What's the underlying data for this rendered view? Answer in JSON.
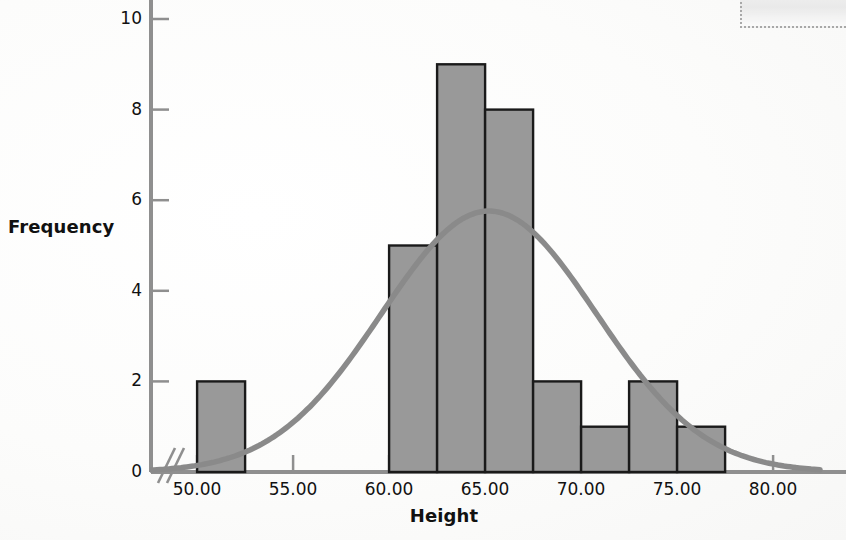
{
  "chart_data": {
    "type": "bar",
    "title": "",
    "subtitle": "",
    "xlabel": "Height",
    "ylabel": "Frequency",
    "xlim": [
      48.0,
      83.0
    ],
    "ylim": [
      0,
      10.4
    ],
    "grid": false,
    "legend": "none",
    "bin_width": 2.5,
    "categories": [
      "50.00-52.50",
      "60.00-62.50",
      "62.50-65.00",
      "65.00-67.50",
      "67.50-70.00",
      "70.00-72.50",
      "72.50-75.00",
      "75.00-77.50"
    ],
    "bins": [
      {
        "start": 50.0,
        "end": 52.5,
        "value": 2
      },
      {
        "start": 60.0,
        "end": 62.5,
        "value": 5
      },
      {
        "start": 62.5,
        "end": 65.0,
        "value": 9
      },
      {
        "start": 65.0,
        "end": 67.5,
        "value": 8
      },
      {
        "start": 67.5,
        "end": 70.0,
        "value": 2
      },
      {
        "start": 70.0,
        "end": 72.5,
        "value": 1
      },
      {
        "start": 72.5,
        "end": 75.0,
        "value": 2
      },
      {
        "start": 75.0,
        "end": 77.5,
        "value": 1
      }
    ],
    "values": [
      2,
      5,
      9,
      8,
      2,
      1,
      2,
      1
    ],
    "overlay": {
      "type": "normal-curve",
      "label": "Normal distribution curve",
      "peak_value": 5.76,
      "peak_x": 65.2,
      "sigma": 5.6
    },
    "xticks": [
      "50.00",
      "55.00",
      "60.00",
      "65.00",
      "70.00",
      "75.00",
      "80.00"
    ],
    "xtick_values": [
      50,
      55,
      60,
      65,
      70,
      75,
      80
    ],
    "yticks": [
      "0",
      "2",
      "4",
      "6",
      "8",
      "10"
    ],
    "ytick_values": [
      0,
      2,
      4,
      6,
      8,
      10
    ],
    "axis_break": "y-axis scale break near origin",
    "colors": {
      "bar_fill": "#999999",
      "bar_stroke": "#1a1a1a",
      "curve": "#8a8a8a",
      "axis": "#8f8f8f",
      "text": "#111111",
      "background": "#fdfdfd"
    }
  }
}
